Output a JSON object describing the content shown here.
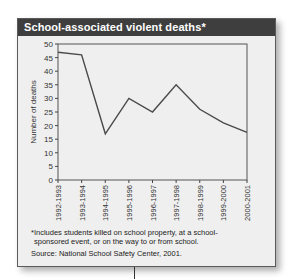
{
  "title": "School-associated violent deaths*",
  "footnote": "*Includes students killed on school property, at a school-sponsored event, or on the way to or from school.",
  "footnote_line1": "*Includes students killed on school property, at a school-",
  "footnote_line2": "sponsored event, or on the way to or from school.",
  "source": "Source: National School Safety Center, 2001.",
  "colors": {
    "header_bg": "#3e3e3e",
    "card_bg": "#efefef",
    "line": "#4a4a4a"
  },
  "chart_data": {
    "type": "line",
    "title": "School-associated violent deaths*",
    "xlabel": "",
    "ylabel": "Number of deaths",
    "categories": [
      "1992-1993",
      "1993-1994",
      "1994-1995",
      "1995-1996",
      "1996-1997",
      "1997-1998",
      "1998-1999",
      "1999-2000",
      "2000-2001"
    ],
    "series": [
      {
        "name": "School-associated violent deaths",
        "values": [
          47,
          46,
          17,
          30,
          25,
          35,
          26,
          21,
          17.5
        ]
      }
    ],
    "ylim": [
      0,
      50
    ],
    "yticks": [
      0,
      5,
      10,
      15,
      20,
      25,
      30,
      35,
      40,
      45,
      50
    ],
    "grid": false,
    "legend": "none"
  }
}
